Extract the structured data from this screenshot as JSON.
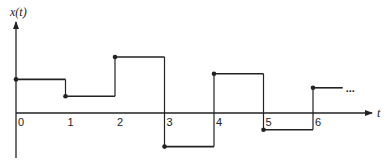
{
  "chart_data": {
    "type": "line",
    "subtype": "step (piecewise-constant, right-continuous)",
    "title": "",
    "ylabel": "x(t)",
    "xlabel": "t",
    "x_ticks": [
      "0",
      "1",
      "2",
      "3",
      "4",
      "5",
      "6"
    ],
    "steps": [
      {
        "t_start": 0,
        "t_end": 1,
        "value": 0.6
      },
      {
        "t_start": 1,
        "t_end": 2,
        "value": 0.3
      },
      {
        "t_start": 2,
        "t_end": 3,
        "value": 1.0
      },
      {
        "t_start": 3,
        "t_end": 4,
        "value": -0.6
      },
      {
        "t_start": 4,
        "t_end": 5,
        "value": 0.7
      },
      {
        "t_start": 5,
        "t_end": 6,
        "value": -0.3
      },
      {
        "t_start": 6,
        "t_end": 6.6,
        "value": 0.45
      }
    ],
    "continuation": "...",
    "grid": false,
    "legend": null,
    "y_ticks": []
  }
}
